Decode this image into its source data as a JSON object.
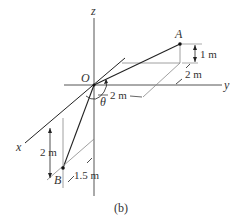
{
  "figure": {
    "caption": "(b)",
    "axes": {
      "x": "x",
      "y": "y",
      "z": "z"
    },
    "points": {
      "origin": "O",
      "a": "A",
      "b": "B"
    },
    "angle": "θ",
    "dimensions": {
      "a_height": "1 m",
      "a_depth": "2 m",
      "a_along_y": "2 m",
      "b_height": "2 m",
      "b_offset": "1.5 m"
    },
    "colors": {
      "line": "#222222",
      "axis": "#555555",
      "construction": "#888888"
    }
  }
}
